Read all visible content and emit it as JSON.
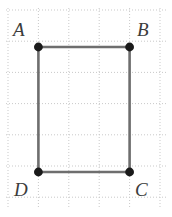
{
  "figure": {
    "kind": "geometry-diagram",
    "background_color": "#ffffff",
    "canvas": {
      "width": 172,
      "height": 217
    },
    "grid": {
      "visible": true,
      "style": "dotted",
      "color": "#c8c8c8",
      "spacing_x": 30.4,
      "spacing_y": 31.2,
      "x_lines": [
        8,
        38.4,
        68.8,
        99.2,
        129.6,
        160
      ],
      "y_lines": [
        10,
        41.2,
        72.4,
        103.6,
        134.8,
        166,
        197.2
      ]
    },
    "shape": {
      "name": "rectangle-ABCD",
      "stroke_color": "#6e6e6e",
      "stroke_width": 2.6,
      "fill": "none",
      "vertex_dot_color": "#1a1a1a",
      "vertex_dot_radius": 4.4,
      "vertices": [
        {
          "id": "A",
          "label": "A",
          "x": 38.4,
          "y": 47.0,
          "label_x": 13,
          "label_y": 20
        },
        {
          "id": "B",
          "label": "B",
          "x": 129.6,
          "y": 47.0,
          "label_x": 137,
          "label_y": 20
        },
        {
          "id": "C",
          "label": "C",
          "x": 129.6,
          "y": 172.0,
          "label_x": 135,
          "label_y": 180
        },
        {
          "id": "D",
          "label": "D",
          "x": 38.4,
          "y": 172.0,
          "label_x": 14,
          "label_y": 180
        }
      ],
      "edges": [
        {
          "id": "AB",
          "from": "A",
          "to": "B"
        },
        {
          "id": "BC",
          "from": "B",
          "to": "C"
        },
        {
          "id": "CD",
          "from": "C",
          "to": "D"
        },
        {
          "id": "DA",
          "from": "D",
          "to": "A"
        }
      ],
      "width_px": 91.2,
      "height_px": 125.0,
      "width_cells": 3,
      "height_cells": 4
    },
    "labels": {
      "A": "A",
      "B": "B",
      "C": "C",
      "D": "D"
    }
  }
}
